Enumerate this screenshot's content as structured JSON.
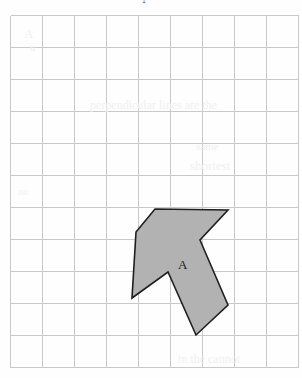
{
  "page": {
    "background_color": "#fefefe",
    "width": 302,
    "height": 378,
    "top_mark_glyph": "↓"
  },
  "grid": {
    "name": "square-grid",
    "origin_x": 10,
    "origin_y": 15,
    "cell_size": 32,
    "columns": 9,
    "rows": 11,
    "line_color": "#c9c9c9",
    "border_color": "#c9c9c9",
    "line_width": 1
  },
  "figure": {
    "label": "A",
    "label_x": 178,
    "label_y": 258,
    "fill_color": "#b2b2b2",
    "stroke_color": "#1f1f1f",
    "stroke_width": 1.6,
    "points": "155,209 228,210 200,240 228,305 196,335 168,272 132,298 136,232",
    "vertices": [
      {
        "name": "top-left-corner",
        "x": 155,
        "y": 209
      },
      {
        "name": "top-right-tip",
        "x": 228,
        "y": 210
      },
      {
        "name": "inner-notch-right",
        "x": 200,
        "y": 240
      },
      {
        "name": "right-tail-corner",
        "x": 228,
        "y": 305
      },
      {
        "name": "bottom-tip",
        "x": 196,
        "y": 335
      },
      {
        "name": "inner-peak",
        "x": 168,
        "y": 272
      },
      {
        "name": "bottom-left-tip",
        "x": 132,
        "y": 298
      },
      {
        "name": "left-corner",
        "x": 136,
        "y": 232
      }
    ]
  },
  "bleed_text": [
    {
      "text": "A",
      "x": 24,
      "y": 26,
      "size": 13
    },
    {
      "text": "u",
      "x": 30,
      "y": 42,
      "size": 10
    },
    {
      "text": "perpendicular lines are the",
      "x": 90,
      "y": 98,
      "size": 12
    },
    {
      "text": "same",
      "x": 196,
      "y": 140,
      "size": 11
    },
    {
      "text": "shortest",
      "x": 190,
      "y": 158,
      "size": 13
    },
    {
      "text": "nn",
      "x": 18,
      "y": 186,
      "size": 10
    },
    {
      "text": "in the cannot",
      "x": 178,
      "y": 352,
      "size": 12
    }
  ]
}
